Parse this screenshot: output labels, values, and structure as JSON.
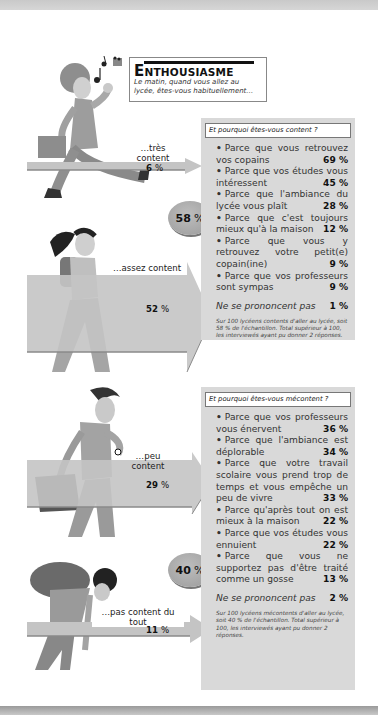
{
  "header": {
    "title_initial": "E",
    "title_rest": "NTHOUSIASME",
    "subtitle": "Le matin, quand vous allez au lycée, êtes-vous habituellement…"
  },
  "responses": [
    {
      "label": "…très content",
      "label_line1": "…très",
      "label_line2": "content",
      "value": "6",
      "unit": "%"
    },
    {
      "label": "…assez content",
      "value": "52",
      "unit": "%"
    },
    {
      "label": "…peu content",
      "value": "29",
      "unit": "%"
    },
    {
      "label": "…pas content du tout",
      "value": "11",
      "unit": "%"
    }
  ],
  "badges": {
    "content": {
      "value": "58",
      "unit": "%"
    },
    "mecontent": {
      "value": "40",
      "unit": "%"
    }
  },
  "panel_content": {
    "question": "Et pourquoi êtes-vous content ?",
    "reasons": [
      {
        "text": "Parce que vous retrouvez vos copains",
        "pct": "69 %"
      },
      {
        "text": "Parce que vos études vous intéressent",
        "pct": "45 %"
      },
      {
        "text": "Parce que l'ambiance du lycée vous plaît",
        "pct": "28 %"
      },
      {
        "text": "Parce que c'est toujours mieux qu'à la maison",
        "pct": "12 %"
      },
      {
        "text": "Parce que vous y retrouvez votre petit(e) copain(ine)",
        "pct": "9 %"
      },
      {
        "text": "Parce que vos professeurs sont sympas",
        "pct": "9 %"
      }
    ],
    "no_answer": {
      "text": "Ne se prononcent pas",
      "pct": "1 %"
    },
    "note": "Sur 100 lycéens contents d'aller au lycée, soit 58 % de l'échantillon. Total supérieur à 100, les interviewés ayant pu donner 2 réponses."
  },
  "panel_mecontent": {
    "question": "Et pourquoi êtes-vous mécontent ?",
    "reasons": [
      {
        "text": "Parce que vos professeurs vous énervent",
        "pct": "36 %"
      },
      {
        "text": "Parce que l'ambiance est déplorable",
        "pct": "34 %"
      },
      {
        "text": "Parce que votre travail scolaire vous prend trop de temps et vous empêche un peu de vivre",
        "pct": "33 %"
      },
      {
        "text": "Parce qu'après tout on est mieux à la maison",
        "pct": "22 %"
      },
      {
        "text": "Parce que vos études vous ennuient",
        "pct": "22 %"
      },
      {
        "text": "Parce que vous ne supportez pas d'être traité comme un gosse",
        "pct": "13 %"
      }
    ],
    "no_answer": {
      "text": "Ne se prononcent pas",
      "pct": "2 %"
    },
    "note": "Sur 100 lycéens mécontents d'aller au lycée, soit 40 % de l'échantillon. Total supérieur à 100, les interviewés ayant pu donner 2 réponses."
  },
  "colors": {
    "panel_bg": "#d9d9d9",
    "arrow_fill": "#c4c4c4",
    "arrow_edge": "#8a8a8a",
    "badge": "#aaaaaa"
  }
}
